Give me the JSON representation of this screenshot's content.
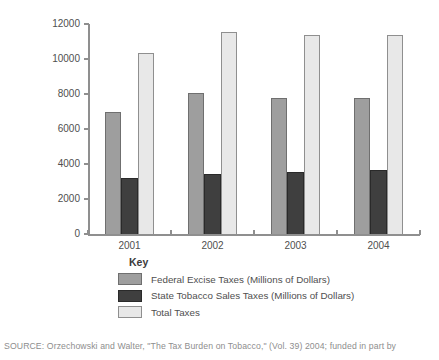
{
  "chart_data": {
    "type": "bar",
    "title": "",
    "xlabel": "",
    "ylabel": "",
    "categories": [
      "2001",
      "2002",
      "2003",
      "2004"
    ],
    "series": [
      {
        "name": "Federal Excise Taxes (Millions of Dollars)",
        "slug": "federal-excise-taxes",
        "color": "#9e9e9e",
        "border_color": "#6f6f6f",
        "values": [
          7000,
          8050,
          7800,
          7750
        ]
      },
      {
        "name": "State Tobacco Sales Taxes (Millions of Dollars)",
        "slug": "state-tobacco-sales-taxes",
        "color": "#3f3f3f",
        "border_color": "#2a2a2a",
        "values": [
          3200,
          3450,
          3550,
          3650
        ]
      },
      {
        "name": "Total Taxes",
        "slug": "total-taxes",
        "color": "#e8e8e8",
        "border_color": "#8f8f8f",
        "values": [
          10350,
          11550,
          11400,
          11400
        ]
      }
    ],
    "ylim": [
      0,
      12000
    ],
    "yticks": [
      0,
      2000,
      4000,
      6000,
      8000,
      10000,
      12000
    ],
    "grid": false,
    "legend_title": "Key",
    "legend_position": "below-left",
    "axis_color": "#8f8f8f",
    "tick_label_color": "#4f4f4f"
  },
  "source_note": "SOURCE: Orzechowski and Walter, \"The Tax Burden on Tobacco,\" (Vol. 39) 2004; funded in part by"
}
